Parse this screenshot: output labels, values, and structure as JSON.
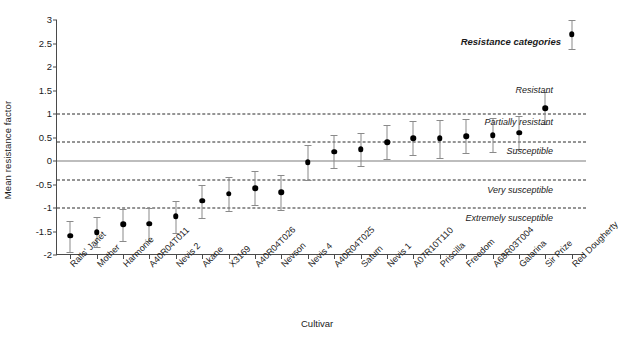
{
  "chart_data": {
    "type": "scatter",
    "title": "",
    "xlabel": "Cultivar",
    "ylabel": "Mean resistance factor",
    "ylim": [
      -2,
      3
    ],
    "yticks": [
      "3",
      "2.5",
      "2",
      "1.5",
      "1",
      "0.5",
      "0",
      "-0.5",
      "-1",
      "-1.5",
      "-2"
    ],
    "ytick_values": [
      3,
      2.5,
      2,
      1.5,
      1,
      0.5,
      0,
      -0.5,
      -1,
      -1.5,
      -2
    ],
    "grid": false,
    "legend": "none",
    "errorbar_note": "vertical bars show confidence interval around each mean",
    "categories": [
      "Ralls' Janet",
      "Mother",
      "Harmonie",
      "A40R04T011",
      "Nevis 2",
      "Akane",
      "X3169",
      "A40R04T026",
      "Nevson",
      "Nevis 4",
      "A40R04T025",
      "Saturn",
      "Nevis 1",
      "A07R10T110",
      "Priscilla",
      "Freedom",
      "A68R03T004",
      "Galarina",
      "Sir Prize",
      "Red Dougherty"
    ],
    "values": [
      -1.59,
      -1.52,
      -1.35,
      -1.33,
      -1.18,
      -0.85,
      -0.7,
      -0.58,
      -0.66,
      -0.03,
      0.2,
      0.25,
      0.4,
      0.48,
      0.48,
      0.53,
      0.55,
      0.6,
      1.12,
      2.7
    ],
    "err_low": [
      -1.93,
      -1.84,
      -1.71,
      -1.7,
      -1.54,
      -1.22,
      -1.06,
      -0.94,
      -1.05,
      -0.41,
      -0.14,
      -0.1,
      0.05,
      0.12,
      0.07,
      0.18,
      0.2,
      0.25,
      0.78,
      2.38
    ],
    "err_high": [
      -1.27,
      -1.2,
      -1.02,
      -1.0,
      -0.85,
      -0.5,
      -0.35,
      -0.22,
      -0.29,
      0.34,
      0.55,
      0.6,
      0.77,
      0.85,
      0.88,
      0.9,
      0.92,
      0.95,
      1.47,
      3.0
    ],
    "reference_lines": [
      {
        "value": 1,
        "style": "dashed"
      },
      {
        "value": 0.4,
        "style": "dashed"
      },
      {
        "value": 0,
        "style": "solid"
      },
      {
        "value": -0.4,
        "style": "dashed"
      },
      {
        "value": -1,
        "style": "dashed"
      }
    ],
    "annotations": [
      {
        "text": "Resistance categories",
        "value": 2.55,
        "bold": true
      },
      {
        "text": "Resistant",
        "value": 1.52,
        "bold": false
      },
      {
        "text": "Partially resistant",
        "value": 0.83,
        "bold": false
      },
      {
        "text": "Susceptible",
        "value": 0.22,
        "bold": false
      },
      {
        "text": "Very susceptible",
        "value": -0.62,
        "bold": false
      },
      {
        "text": "Extremely susceptible",
        "value": -1.22,
        "bold": false
      }
    ]
  }
}
